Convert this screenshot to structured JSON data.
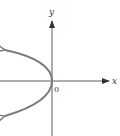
{
  "diagram": {
    "type": "graph-of-parabola",
    "axes": {
      "x_label": "x",
      "y_label": "y",
      "origin_label": "0"
    },
    "curve": {
      "vertex": [
        0,
        0
      ],
      "opens": "left",
      "arrows_on_ends": true
    },
    "colors": {
      "axis": "#333333",
      "curve": "#7a7a7a",
      "background": "#ffffff"
    }
  }
}
